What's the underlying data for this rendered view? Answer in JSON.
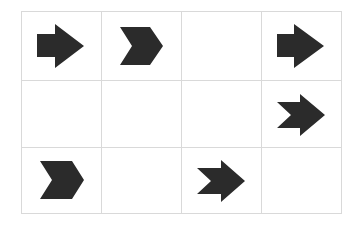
{
  "puzzle": {
    "grid": {
      "rows": 3,
      "cols": 4,
      "line_color": "#d9d9d9",
      "col_edges": [
        21,
        101,
        181,
        261,
        341
      ],
      "row_edges": [
        11,
        80,
        147,
        213
      ]
    },
    "fill_color": "#2b2b2b",
    "cells": [
      {
        "row": 0,
        "col": 0,
        "icon": "block-arrow-right-icon",
        "points": "37,34 55,34 55,24 84,46 55,68 55,57 37,57"
      },
      {
        "row": 0,
        "col": 1,
        "icon": "chevron-right-icon",
        "points": "120,27 150,27 163,46 150,65 120,65 132,46"
      },
      {
        "row": 0,
        "col": 2,
        "icon": "empty",
        "points": ""
      },
      {
        "row": 0,
        "col": 3,
        "icon": "block-arrow-right-icon",
        "points": "277,34 294,34 294,24 324,46 294,68 294,57 277,57"
      },
      {
        "row": 1,
        "col": 0,
        "icon": "empty",
        "points": ""
      },
      {
        "row": 1,
        "col": 1,
        "icon": "empty",
        "points": ""
      },
      {
        "row": 1,
        "col": 2,
        "icon": "empty",
        "points": ""
      },
      {
        "row": 1,
        "col": 3,
        "icon": "notched-arrow-right-icon",
        "points": "277,102 300,102 300,94 325,115 300,136 300,128 277,128 291,115"
      },
      {
        "row": 2,
        "col": 0,
        "icon": "chevron-right-icon",
        "points": "40,161 72,161 84,180 72,199 40,199 52,180"
      },
      {
        "row": 2,
        "col": 1,
        "icon": "empty",
        "points": ""
      },
      {
        "row": 2,
        "col": 2,
        "icon": "notched-arrow-right-icon",
        "points": "197,168 221,168 221,160 245,181 221,202 221,194 197,194 211,181"
      },
      {
        "row": 2,
        "col": 3,
        "icon": "empty",
        "points": ""
      }
    ]
  }
}
